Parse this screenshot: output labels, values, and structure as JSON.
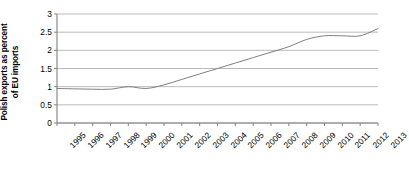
{
  "chart_data": {
    "type": "line",
    "title": "",
    "subtitle": "",
    "xlabel": "",
    "ylabel": "Polish exports as percent\nof EU imports",
    "ylabel_lines": [
      "Polish exports as percent",
      "of EU imports"
    ],
    "categories": [
      "1995",
      "1996",
      "1997",
      "1998",
      "1999",
      "2000",
      "2001",
      "2002",
      "2003",
      "2004",
      "2005",
      "2006",
      "2007",
      "2008",
      "2009",
      "2010",
      "2011",
      "2012",
      "2013"
    ],
    "values": [
      0.95,
      0.94,
      0.93,
      0.93,
      1.0,
      0.95,
      1.05,
      1.2,
      1.35,
      1.5,
      1.65,
      1.8,
      1.95,
      2.1,
      2.3,
      2.4,
      2.4,
      2.4,
      2.6
    ],
    "series": [
      {
        "name": "Polish exports as percent of EU imports",
        "color": "#808080",
        "values": [
          0.95,
          0.94,
          0.93,
          0.93,
          1.0,
          0.95,
          1.05,
          1.2,
          1.35,
          1.5,
          1.65,
          1.8,
          1.95,
          2.1,
          2.3,
          2.4,
          2.4,
          2.4,
          2.6
        ]
      }
    ],
    "yticks": [
      0,
      0.5,
      1,
      1.5,
      2,
      2.5,
      3
    ],
    "ytick_labels": [
      "0",
      "0.5",
      "1",
      "1.5",
      "2",
      "2.5",
      "3"
    ],
    "ylim": [
      0,
      3
    ],
    "xlim": [
      1995,
      2013
    ],
    "grid": "horizontal",
    "legend": "none",
    "legend_position": "none",
    "annotations": [],
    "colors": {
      "line": "#808080",
      "grid": "#aaaaaa",
      "axis": "#808080",
      "text": "#000000",
      "background": "#ffffff"
    }
  }
}
